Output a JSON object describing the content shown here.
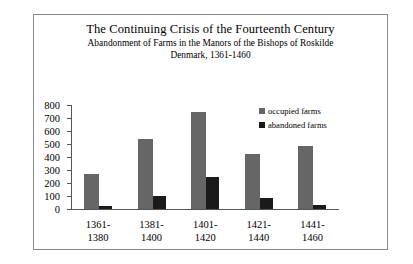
{
  "chart_data": {
    "type": "bar",
    "title": "The Continuing Crisis of the Fourteenth Century",
    "subtitle": "Abandonment of Farms in the Manors of the Bishops of Roskilde",
    "subtitle2": "Denmark, 1361-1460",
    "categories": [
      "1361-1380",
      "1381-1400",
      "1401-1420",
      "1421-1440",
      "1441-1460"
    ],
    "categories_lines": [
      [
        "1361-",
        "1380"
      ],
      [
        "1381-",
        "1400"
      ],
      [
        "1401-",
        "1420"
      ],
      [
        "1421-",
        "1440"
      ],
      [
        "1441-",
        "1460"
      ]
    ],
    "series": [
      {
        "name": "occupied farms",
        "color": "#666666",
        "values": [
          270,
          540,
          745,
          420,
          485
        ]
      },
      {
        "name": "abandoned farms",
        "color": "#1a1a1a",
        "values": [
          25,
          100,
          250,
          85,
          30
        ]
      }
    ],
    "xlabel": "",
    "ylabel": "",
    "ylim": [
      0,
      800
    ],
    "yticks": [
      800,
      700,
      600,
      500,
      400,
      300,
      200,
      100,
      0
    ],
    "grid": false,
    "legend_position": "right"
  },
  "legend": {
    "items": [
      {
        "label": "occupied farms"
      },
      {
        "label": "abandoned farms"
      }
    ]
  }
}
